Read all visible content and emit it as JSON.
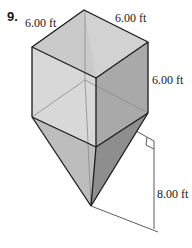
{
  "problem": {
    "number": "9.",
    "labels": {
      "top_left_edge": "6.00 ft",
      "top_right_edge": "6.00 ft",
      "vertical_edge": "6.00 ft",
      "pyramid_height": "8.00 ft"
    },
    "figure": "cube-with-square-pyramid-below"
  }
}
